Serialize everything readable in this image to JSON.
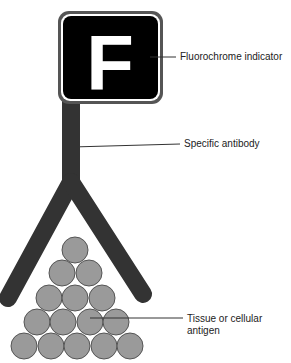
{
  "diagram": {
    "fluorochrome": {
      "letter": "F",
      "label": "Fluorochrome indicator"
    },
    "antibody": {
      "label": "Specific antibody"
    },
    "antigen": {
      "label": "Tissue or cellular antigen",
      "rows": [
        1,
        2,
        3,
        4,
        5
      ]
    },
    "colors": {
      "box_fill": "#000000",
      "box_border": "#555555",
      "antibody": "#333333",
      "antigen_fill": "#9a9a9a",
      "antigen_stroke": "#555555",
      "leader": "#333333"
    }
  }
}
